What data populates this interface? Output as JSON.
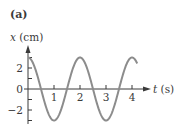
{
  "figure": {
    "panel_label": "(a)",
    "y_axis": {
      "var": "x",
      "unit": " (cm)"
    },
    "x_axis": {
      "var": "t",
      "unit": " (s)"
    },
    "y_ticks": [
      {
        "value": 2,
        "label": "2"
      },
      {
        "value": 0,
        "label": "0"
      },
      {
        "value": -2,
        "label": "−2"
      }
    ],
    "x_ticks": [
      {
        "value": 1,
        "label": "1"
      },
      {
        "value": 2,
        "label": "2"
      },
      {
        "value": 3,
        "label": "3"
      },
      {
        "value": 4,
        "label": "4"
      }
    ],
    "colors": {
      "axis": "#3a3a3a",
      "curve": "#8c8c8c",
      "text": "#3a3a3a"
    }
  },
  "chart_data": {
    "type": "line",
    "title": "(a)",
    "xlabel": "t (s)",
    "ylabel": "x (cm)",
    "function": "x(t) = 3 cos(π t)",
    "amplitude_cm": 3,
    "period_s": 2,
    "xlim": [
      0,
      4.2
    ],
    "ylim": [
      -3,
      3
    ],
    "x_tick_values": [
      1,
      2,
      3,
      4
    ],
    "y_tick_values": [
      -3,
      -2,
      -1,
      0,
      1,
      2,
      3
    ],
    "y_tick_labels": [
      "2",
      "0",
      "−2"
    ],
    "x": [
      0,
      0.5,
      1,
      1.5,
      2,
      2.5,
      3,
      3.5,
      4,
      4.2
    ],
    "series": [
      {
        "name": "x(t)",
        "values": [
          3,
          0,
          -3,
          0,
          3,
          0,
          -3,
          0,
          3,
          2.43
        ]
      }
    ],
    "grid": false,
    "legend": "none"
  }
}
